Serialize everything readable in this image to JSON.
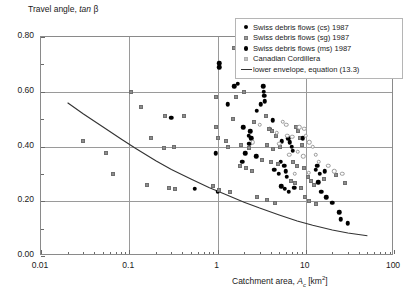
{
  "chart_data": {
    "type": "scatter",
    "title": "",
    "ylabel": "Travel angle, tan β",
    "xlabel": "Catchment area, A_c [km²]",
    "xscale": "log",
    "xlim": [
      0.01,
      100
    ],
    "ylim": [
      0.0,
      0.8
    ],
    "grid": true,
    "xticks": [
      "0.01",
      "0.1",
      "1",
      "10",
      "100"
    ],
    "yticks": [
      "0.00",
      "0.20",
      "0.40",
      "0.60",
      "0.80"
    ],
    "ytick_minor": [
      0.1,
      0.3,
      0.5,
      0.7
    ],
    "legend_position": "top-right",
    "legend": [
      {
        "label": "Swiss debris flows (cs) 1987",
        "marker": "filled-circle",
        "color": "#000000"
      },
      {
        "label": "Swiss debris flows (sg) 1987",
        "marker": "small-gray-square",
        "color": "#9a9a9a"
      },
      {
        "label": "Swiss debris flows (ms) 1987",
        "marker": "filled-circle",
        "color": "#000000"
      },
      {
        "label": "Canadian Cordillera",
        "marker": "light-gray-square",
        "color": "#c2c2c2"
      },
      {
        "label": "lower envelope, equation (13.3)",
        "marker": "line",
        "color": "#333333"
      }
    ],
    "series": [
      {
        "name": "Swiss debris flows (cs) 1987",
        "marker": "filled-circle",
        "points": [
          [
            0.3,
            0.505
          ],
          [
            1.05,
            0.705
          ],
          [
            1.05,
            0.69
          ],
          [
            1.55,
            0.62
          ],
          [
            3.3,
            0.62
          ],
          [
            1.3,
            0.555
          ],
          [
            3.35,
            0.6
          ],
          [
            3.4,
            0.585
          ],
          [
            3.45,
            0.565
          ],
          [
            3.1,
            0.555
          ],
          [
            1.95,
            0.47
          ],
          [
            2.35,
            0.455
          ],
          [
            2.25,
            0.44
          ],
          [
            2.4,
            0.43
          ],
          [
            2.3,
            0.41
          ],
          [
            3.9,
            0.465
          ],
          [
            0.95,
            0.375
          ],
          [
            2.05,
            0.375
          ],
          [
            2.75,
            0.365
          ],
          [
            1.9,
            0.345
          ],
          [
            5.2,
            0.345
          ],
          [
            4.4,
            0.315
          ],
          [
            4.95,
            0.3
          ],
          [
            5.35,
            0.42
          ],
          [
            6.3,
            0.43
          ],
          [
            6.6,
            0.415
          ],
          [
            6.9,
            0.4
          ],
          [
            7.1,
            0.385
          ],
          [
            5.7,
            0.33
          ],
          [
            5.9,
            0.31
          ],
          [
            6.1,
            0.29
          ],
          [
            5.3,
            0.255
          ],
          [
            5.8,
            0.245
          ],
          [
            6.4,
            0.235
          ],
          [
            7.4,
            0.25
          ],
          [
            13.5,
            0.33
          ],
          [
            13.0,
            0.315
          ],
          [
            14.5,
            0.3
          ],
          [
            16.5,
            0.31
          ],
          [
            13.8,
            0.27
          ],
          [
            15.0,
            0.235
          ],
          [
            17.0,
            0.215
          ],
          [
            20.0,
            0.195
          ],
          [
            24.0,
            0.16
          ],
          [
            25.0,
            0.135
          ],
          [
            30.0,
            0.12
          ],
          [
            0.55,
            0.245
          ],
          [
            1.0,
            0.235
          ]
        ]
      },
      {
        "name": "Swiss debris flows (sg) 1987",
        "marker": "small-gray-square",
        "points": [
          [
            0.03,
            0.42
          ],
          [
            0.055,
            0.375
          ],
          [
            0.105,
            0.6
          ],
          [
            0.135,
            0.545
          ],
          [
            0.175,
            0.43
          ],
          [
            0.245,
            0.395
          ],
          [
            0.255,
            0.51
          ],
          [
            0.42,
            0.51
          ],
          [
            0.32,
            0.4
          ],
          [
            0.95,
            0.58
          ],
          [
            0.97,
            0.47
          ],
          [
            1.0,
            0.43
          ],
          [
            1.25,
            0.42
          ],
          [
            1.3,
            0.4
          ],
          [
            0.9,
            0.255
          ],
          [
            1.05,
            0.24
          ],
          [
            1.4,
            0.235
          ],
          [
            1.55,
            0.76
          ],
          [
            1.6,
            0.58
          ],
          [
            2.0,
            0.6
          ],
          [
            1.5,
            0.5
          ],
          [
            2.6,
            0.49
          ],
          [
            1.85,
            0.405
          ],
          [
            2.3,
            0.395
          ],
          [
            1.8,
            0.33
          ],
          [
            2.1,
            0.32
          ],
          [
            2.45,
            0.31
          ],
          [
            3.55,
            0.51
          ],
          [
            3.8,
            0.465
          ],
          [
            4.1,
            0.455
          ],
          [
            4.6,
            0.44
          ],
          [
            3.6,
            0.405
          ],
          [
            4.3,
            0.39
          ],
          [
            3.2,
            0.35
          ],
          [
            4.0,
            0.345
          ],
          [
            4.8,
            0.335
          ],
          [
            5.1,
            0.4
          ],
          [
            7.8,
            0.47
          ],
          [
            8.2,
            0.455
          ],
          [
            8.6,
            0.43
          ],
          [
            9.0,
            0.405
          ],
          [
            7.2,
            0.345
          ],
          [
            8.0,
            0.33
          ],
          [
            9.5,
            0.32
          ],
          [
            6.8,
            0.275
          ],
          [
            7.6,
            0.265
          ],
          [
            8.8,
            0.25
          ],
          [
            10.5,
            0.29
          ],
          [
            11.5,
            0.275
          ],
          [
            12.5,
            0.26
          ],
          [
            16.0,
            0.28
          ],
          [
            22.0,
            0.295
          ],
          [
            28.0,
            0.265
          ],
          [
            0.16,
            0.26
          ],
          [
            0.28,
            0.25
          ],
          [
            0.33,
            0.245
          ],
          [
            2.8,
            0.215
          ],
          [
            3.6,
            0.205
          ],
          [
            4.5,
            0.195
          ],
          [
            9.8,
            0.215
          ],
          [
            11.0,
            0.2
          ],
          [
            13.0,
            0.19
          ],
          [
            0.065,
            0.3
          ]
        ]
      },
      {
        "name": "Swiss debris flows (ms) 1987",
        "marker": "filled-circle",
        "points": [
          [
            1.7,
            0.63
          ],
          [
            2.8,
            0.53
          ],
          [
            4.2,
            0.495
          ],
          [
            9.2,
            0.43
          ]
        ]
      },
      {
        "name": "Canadian Cordillera",
        "marker": "light-gray-square",
        "points": [
          [
            5.5,
            0.49
          ],
          [
            6.0,
            0.48
          ],
          [
            8.4,
            0.47
          ],
          [
            9.6,
            0.465
          ],
          [
            6.2,
            0.44
          ],
          [
            7.0,
            0.435
          ],
          [
            10.0,
            0.44
          ],
          [
            4.7,
            0.45
          ],
          [
            5.0,
            0.41
          ],
          [
            11.0,
            0.415
          ],
          [
            12.0,
            0.4
          ],
          [
            8.1,
            0.38
          ],
          [
            6.5,
            0.37
          ],
          [
            9.4,
            0.365
          ],
          [
            13.0,
            0.37
          ],
          [
            7.5,
            0.3
          ],
          [
            10.8,
            0.305
          ],
          [
            14.0,
            0.345
          ],
          [
            18.0,
            0.33
          ],
          [
            21.0,
            0.31
          ],
          [
            26.0,
            0.3
          ],
          [
            3.0,
            0.48
          ],
          [
            2.5,
            0.415
          ]
        ]
      }
    ],
    "envelope": {
      "label": "lower envelope, equation (13.3)",
      "color": "#333333",
      "points": [
        [
          0.02,
          0.56
        ],
        [
          0.03,
          0.52
        ],
        [
          0.05,
          0.472
        ],
        [
          0.08,
          0.428
        ],
        [
          0.12,
          0.392
        ],
        [
          0.2,
          0.348
        ],
        [
          0.3,
          0.316
        ],
        [
          0.5,
          0.281
        ],
        [
          0.8,
          0.25
        ],
        [
          1.2,
          0.226
        ],
        [
          2.0,
          0.196
        ],
        [
          3.0,
          0.175
        ],
        [
          5.0,
          0.15
        ],
        [
          8.0,
          0.128
        ],
        [
          12.0,
          0.112
        ],
        [
          20.0,
          0.095
        ],
        [
          30.0,
          0.084
        ],
        [
          50.0,
          0.074
        ]
      ]
    }
  }
}
